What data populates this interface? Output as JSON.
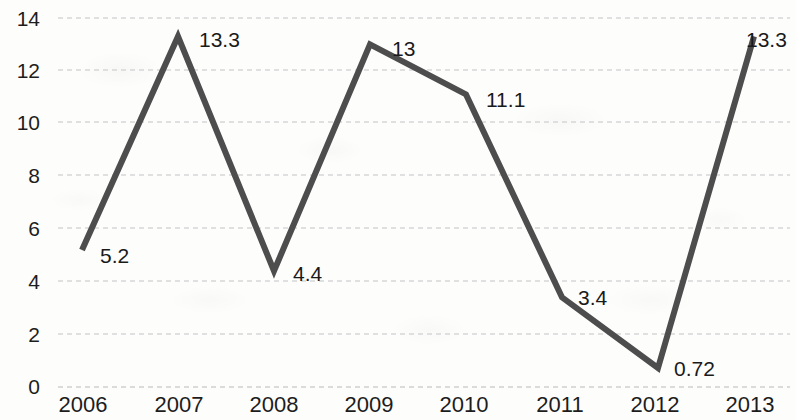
{
  "chart_data": {
    "type": "line",
    "title": "",
    "subtitle": "",
    "xlabel": "",
    "ylabel": "",
    "categories": [
      "2006",
      "2007",
      "2008",
      "2009",
      "2010",
      "2011",
      "2012",
      "2013"
    ],
    "values": [
      5.2,
      13.3,
      4.4,
      13,
      11.1,
      3.4,
      0.72,
      13.3
    ],
    "point_labels": [
      "5.2",
      "13.3",
      "4.4",
      "13",
      "11.1",
      "3.4",
      "0.72",
      "13.3"
    ],
    "series": [
      {
        "name": "",
        "values": [
          5.2,
          13.3,
          4.4,
          13,
          11.1,
          3.4,
          0.72,
          13.3
        ],
        "color": "#4d4d4d"
      }
    ],
    "ylim": [
      0,
      14
    ],
    "y_ticks": [
      "0",
      "2",
      "4",
      "6",
      "8",
      "10",
      "12",
      "14"
    ],
    "x_ticks": [
      "2006",
      "2007",
      "2008",
      "2009",
      "2010",
      "2011",
      "2012",
      "2013"
    ],
    "grid": true,
    "grid_style": "dotted-horizontal",
    "grid_color": "#d8d8d8",
    "legend": "none",
    "markers": false,
    "line_width_px": 6,
    "background_color": "#fdfdfc",
    "text_color": "#1d1d1d"
  }
}
